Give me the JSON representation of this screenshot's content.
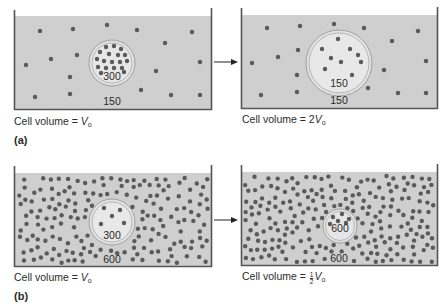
{
  "colors": {
    "solution": "#cfcfcf",
    "cell_interior": "#e6e6e6",
    "membrane": "#9a9a9a",
    "wall": "#555555",
    "particle": "#5a5a5a",
    "arrow": "#222222"
  },
  "panels": [
    {
      "id": "a",
      "label": "(a)",
      "steps": [
        {
          "inner_concentration": "300",
          "outer_concentration": "150",
          "caption": {
            "prefix": "Cell volume = ",
            "symbol": "V",
            "subscript": "o",
            "coefficient": ""
          }
        },
        {
          "inner_concentration": "150",
          "outer_concentration": "150",
          "caption": {
            "prefix": "Cell volume = ",
            "symbol": "V",
            "subscript": "o",
            "coefficient": "2"
          }
        }
      ]
    },
    {
      "id": "b",
      "label": "(b)",
      "steps": [
        {
          "inner_concentration": "300",
          "outer_concentration": "600",
          "caption": {
            "prefix": "Cell volume = ",
            "symbol": "V",
            "subscript": "o",
            "coefficient": ""
          }
        },
        {
          "inner_concentration": "600",
          "outer_concentration": "600",
          "caption": {
            "prefix": "Cell volume = ",
            "symbol": "V",
            "subscript": "o",
            "fraction": {
              "numerator": "1",
              "denominator": "2"
            }
          }
        }
      ]
    }
  ]
}
